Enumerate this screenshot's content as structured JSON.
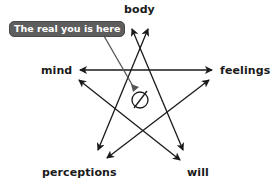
{
  "diagram": {
    "type": "pentagram",
    "callout": {
      "text": "The real you is here",
      "background": "#5e5e5e",
      "text_color": "#ffffff"
    },
    "nodes": {
      "top": "body",
      "left": "mind",
      "right": "feelings",
      "bottom_left": "perceptions",
      "bottom_right": "will"
    },
    "center_symbol": "circle-slash",
    "line_color": "#1a1a1a",
    "connections": [
      {
        "from": "mind",
        "to": "feelings",
        "bidirectional": true
      },
      {
        "from": "body",
        "to": "perceptions",
        "bidirectional": true
      },
      {
        "from": "body",
        "to": "will",
        "bidirectional": true
      },
      {
        "from": "mind",
        "to": "will",
        "bidirectional": true
      },
      {
        "from": "feelings",
        "to": "perceptions",
        "bidirectional": true
      }
    ]
  }
}
